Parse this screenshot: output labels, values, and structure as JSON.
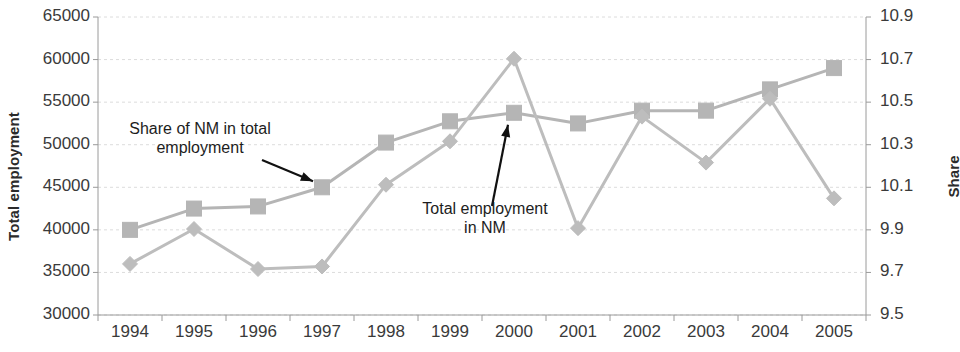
{
  "chart_data": {
    "type": "line",
    "title": "",
    "xlabel": "",
    "categories": [
      "1994",
      "1995",
      "1996",
      "1997",
      "1998",
      "1999",
      "2000",
      "2001",
      "2002",
      "2003",
      "2004",
      "2005"
    ],
    "grid": true,
    "legend_position": "none",
    "axes": {
      "left": {
        "label": "Total employment",
        "ticks": [
          "30000",
          "35000",
          "40000",
          "45000",
          "50000",
          "55000",
          "60000",
          "65000"
        ],
        "tick_values": [
          30000,
          35000,
          40000,
          45000,
          50000,
          55000,
          60000,
          65000
        ],
        "ylim": [
          30000,
          65000
        ]
      },
      "right": {
        "label": "Share",
        "ticks": [
          "9.5",
          "9.7",
          "9.9",
          "10.1",
          "10.3",
          "10.5",
          "10.7",
          "10.9"
        ],
        "tick_values": [
          9.5,
          9.7,
          9.9,
          10.1,
          10.3,
          10.5,
          10.7,
          10.9
        ],
        "ylim": [
          9.5,
          10.9
        ]
      }
    },
    "series": [
      {
        "name": "Share of NM in total employment",
        "axis": "right",
        "marker": "square",
        "color": "#b5b5b5",
        "values": [
          9.9,
          10.0,
          10.01,
          10.1,
          10.31,
          10.41,
          10.45,
          10.4,
          10.46,
          10.46,
          10.56,
          10.66
        ]
      },
      {
        "name": "Total employment in NM",
        "axis": "left",
        "marker": "diamond",
        "color": "#bdbdbd",
        "values": [
          36000,
          40100,
          35400,
          35700,
          45300,
          50400,
          60100,
          40200,
          53300,
          47900,
          55400,
          43700
        ]
      }
    ],
    "annotations": [
      {
        "id": "share-note",
        "text": "Share of NM in total\nemployment",
        "points_to_year": "1997",
        "points_to_series": "Share of NM in total employment"
      },
      {
        "id": "employment-note",
        "text": "Total employment\nin NM",
        "points_to_year": "2000",
        "points_to_series": "Share of NM in total employment"
      }
    ]
  },
  "colors": {
    "grid": "#dcdcdc",
    "axis": "#9a9a9a",
    "marker": "#b5b5b5",
    "annotation_arrow": "#111111",
    "text": "#2b2b2b"
  }
}
